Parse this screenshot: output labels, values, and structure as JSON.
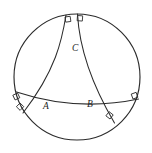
{
  "figure": {
    "background_color": "#ffffff",
    "line_color": "#2b2b2b",
    "label_color": "#1d1d1d"
  },
  "boundary": {
    "name": "boundary-circle",
    "center_x": 77,
    "center_y": 77,
    "radius": 63
  },
  "vertices": [
    {
      "id": "A",
      "label": "A",
      "x": 48,
      "y": 101,
      "label_x": 43,
      "label_y": 109
    },
    {
      "id": "B",
      "label": "B",
      "x": 91,
      "y": 99,
      "label_x": 87,
      "label_y": 107
    },
    {
      "id": "C",
      "label": "C",
      "x": 70,
      "y": 48,
      "label_x": 73,
      "label_y": 48
    }
  ],
  "arcs": [
    {
      "id": "arc-AB",
      "name": "arc-side-AB",
      "from": "left-boundary",
      "to": "right-boundary",
      "path": "M 16.5 92 Q 77 112 138.5 99"
    },
    {
      "id": "arc-AC",
      "name": "arc-side-AC",
      "from": "top-boundary",
      "to": "bottom-left-boundary",
      "path": "M 66 15 Q 60 52 23 113"
    },
    {
      "id": "arc-BC",
      "name": "arc-side-BC",
      "from": "top-boundary",
      "to": "bottom-right-boundary",
      "path": "M 77 14 Q 80 55 114 123"
    }
  ],
  "right_angle_marks": [
    {
      "id": "mark-top-left",
      "name": "right-angle-mark-top-left",
      "x": 65,
      "y": 17,
      "rotation": -8
    },
    {
      "id": "mark-top-right",
      "name": "right-angle-mark-top-right",
      "x": 77.5,
      "y": 16,
      "rotation": 4
    },
    {
      "id": "mark-left-upper",
      "name": "right-angle-mark-left-upper",
      "x": 17.5,
      "y": 93,
      "rotation": 64
    },
    {
      "id": "mark-left-lower",
      "name": "right-angle-mark-left-lower",
      "x": 21,
      "y": 104,
      "rotation": 42
    },
    {
      "id": "mark-right",
      "name": "right-angle-mark-right",
      "x": 132.5,
      "y": 99,
      "rotation": -108
    },
    {
      "id": "mark-bottom-right",
      "name": "right-angle-mark-bottom-right",
      "x": 110,
      "y": 119,
      "rotation": -142
    }
  ],
  "counts": {
    "arcs": 3,
    "vertices": 3,
    "right_angles": 6
  }
}
